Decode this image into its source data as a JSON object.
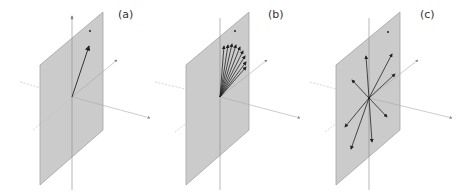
{
  "figure": {
    "colors": {
      "plane_fill": "#c8c8c8",
      "plane_edge": "#a8a8a8",
      "axis": "#b0b0b0",
      "arrow": "#222222",
      "background": "#ffffff"
    },
    "panels": [
      {
        "label": "(a)",
        "description": "single vector in plane",
        "arrow_count": 1
      },
      {
        "label": "(b)",
        "description": "fan of vectors in upper half of plane",
        "arrow_count": 9
      },
      {
        "label": "(c)",
        "description": "vectors radiating in all directions in plane",
        "arrow_count": 8
      }
    ]
  }
}
